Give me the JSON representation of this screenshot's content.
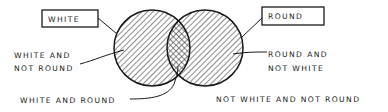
{
  "diagram": {
    "type": "venn",
    "sets": [
      {
        "name": "white",
        "label": "WHITE"
      },
      {
        "name": "round",
        "label": "ROUND"
      }
    ],
    "regions": {
      "white_only": "WHITE AND\nNOT ROUND",
      "white_only_lines": [
        "WHITE AND",
        "NOT ROUND"
      ],
      "round_only_lines": [
        "ROUND AND",
        "NOT WHITE"
      ],
      "intersection": "WHITE AND ROUND",
      "outside": "NOT WHITE AND NOT ROUND"
    },
    "hatching": {
      "white_only": "diagonal",
      "round_only": "diagonal-opposite",
      "intersection": "cross-hatch"
    },
    "colors": {
      "ink": "#1a1a1a",
      "background": "#ffffff"
    }
  }
}
